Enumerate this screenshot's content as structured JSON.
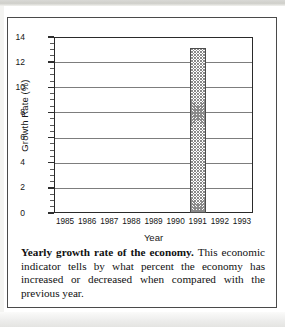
{
  "figure": {
    "caption_lead": "Yearly growth rate of the economy.",
    "caption_body": " This economic indicator tells by what percent the economy has increased or decreased when compared with the previous year."
  },
  "chart_data": {
    "type": "bar",
    "title": "",
    "xlabel": "Year",
    "ylabel": "Growth Rate (%)",
    "categories": [
      "1985",
      "1986",
      "1987",
      "1988",
      "1989",
      "1990",
      "1991",
      "1992",
      "1993"
    ],
    "values": [
      0,
      0,
      0,
      0,
      0,
      0,
      13.1,
      0,
      0
    ],
    "ylim": [
      0,
      14
    ],
    "yticks": [
      0,
      2,
      4,
      6,
      8,
      10,
      12,
      14
    ],
    "ytick_labels": [
      "0",
      "2",
      "4",
      "6",
      "8",
      "10",
      "12",
      "14"
    ],
    "minor_tick_step": 0.5,
    "grid": true,
    "grid_axis": "y",
    "legend": false,
    "bar_fill": "crosshatch",
    "bar_fill_color": "#8a8a8a",
    "bar_edge_color": "#4d4d4d",
    "axis_color": "#2a2a2a",
    "grid_color": "#7d7d7d",
    "annotations": []
  }
}
